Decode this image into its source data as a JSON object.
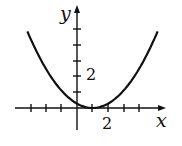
{
  "chart_data": {
    "type": "line",
    "title": "",
    "xlabel": "x",
    "ylabel": "y",
    "x_tick_label": "2",
    "y_tick_label": "2",
    "x_ticks": [
      -3,
      -2,
      -1,
      1,
      2,
      3,
      4,
      5
    ],
    "y_ticks": [
      1,
      2,
      3,
      4,
      5
    ],
    "function": "y = 0.28(x - 1)^2",
    "vertex": [
      1,
      0
    ],
    "xlim": [
      -4,
      5.8
    ],
    "ylim": [
      -1.5,
      6.5
    ],
    "points": [
      [
        -3.2,
        4.94
      ],
      [
        -2,
        2.52
      ],
      [
        -1,
        1.12
      ],
      [
        0,
        0.28
      ],
      [
        1,
        0
      ],
      [
        2,
        0.28
      ],
      [
        3,
        1.12
      ],
      [
        4,
        2.52
      ],
      [
        5.2,
        4.94
      ]
    ]
  },
  "labels": {
    "x": "x",
    "y": "y",
    "x_tick": "2",
    "y_tick": "2"
  }
}
